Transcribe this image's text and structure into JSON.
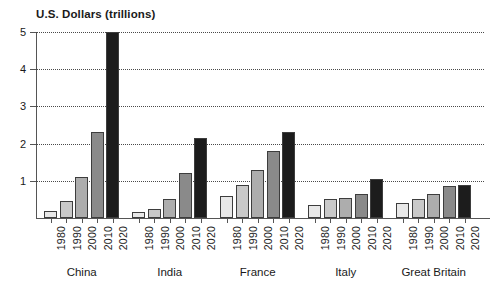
{
  "chart_data": {
    "type": "bar",
    "title": "U.S. Dollars (trillions)",
    "xlabel": "",
    "ylabel": "U.S. Dollars (trillions)",
    "ylim": [
      0,
      5
    ],
    "ytick_labels": [
      "1",
      "2",
      "3",
      "4",
      "5"
    ],
    "ytick_values": [
      1,
      2,
      3,
      4,
      5
    ],
    "grid": true,
    "grid_axis": "y",
    "legend": "none",
    "categories": [
      "1980",
      "1990",
      "2000",
      "2010",
      "2020"
    ],
    "groups": [
      {
        "name": "China",
        "values": [
          0.2,
          0.45,
          1.1,
          2.3,
          5.0
        ]
      },
      {
        "name": "India",
        "values": [
          0.15,
          0.25,
          0.5,
          1.2,
          2.15
        ]
      },
      {
        "name": "France",
        "values": [
          0.6,
          0.9,
          1.3,
          1.8,
          2.3
        ]
      },
      {
        "name": "Italy",
        "values": [
          0.35,
          0.5,
          0.55,
          0.65,
          1.05
        ]
      },
      {
        "name": "Great Britain",
        "values": [
          0.4,
          0.5,
          0.65,
          0.85,
          0.9
        ]
      }
    ],
    "bar_colors": [
      "#e8e8e8",
      "#c9c9c9",
      "#adadad",
      "#8a8a8a",
      "#1c1c1c"
    ],
    "bar_edge_color": "#3d3d3d",
    "grid_color": "#4a4a4a",
    "axis_color": "#555555",
    "text_color": "#1a1a1a",
    "background": "#ffffff"
  }
}
